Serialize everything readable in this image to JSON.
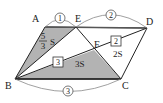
{
  "figure": {
    "type": "parallelogram geometry diagram",
    "vertices": {
      "A": "A",
      "B": "B",
      "C": "C",
      "D": "D",
      "E": "E",
      "F": "F"
    },
    "ratios": {
      "AE": "1",
      "ED": "2",
      "BC": "3"
    },
    "segment_ratio_boxes": {
      "BF": "3",
      "FD": "2"
    },
    "areas": {
      "ABE_numerator": "5",
      "ABE_denominator": "3",
      "ABE_suffix": "S",
      "FBC": "3S",
      "FCD": "2S"
    },
    "colors": {
      "shade": "#b3b3b3",
      "line": "#222222",
      "arc": "#888888"
    }
  }
}
